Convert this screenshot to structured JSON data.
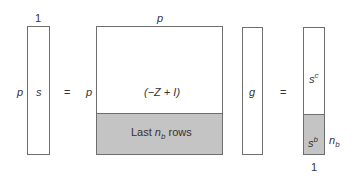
{
  "diagram": {
    "s_vector": {
      "label": "s",
      "top_dim": "1",
      "left_dim": "p"
    },
    "equals1": "=",
    "matrix": {
      "top_dim": "p",
      "left_dim": "p",
      "body_label": "(−Z + I)",
      "shaded_label_prefix": "Last ",
      "shaded_label_var": "n",
      "shaded_label_sub": "b",
      "shaded_label_suffix": " rows"
    },
    "g_vector": {
      "label": "g"
    },
    "equals2": "=",
    "result_vector": {
      "upper_var": "s",
      "upper_sup": "c",
      "lower_var": "s",
      "lower_sup": "b",
      "side_var": "n",
      "side_sub": "b",
      "bottom_dim": "1"
    },
    "colors": {
      "shade": "#c4c4c4",
      "border": "#6e6e6e"
    }
  }
}
